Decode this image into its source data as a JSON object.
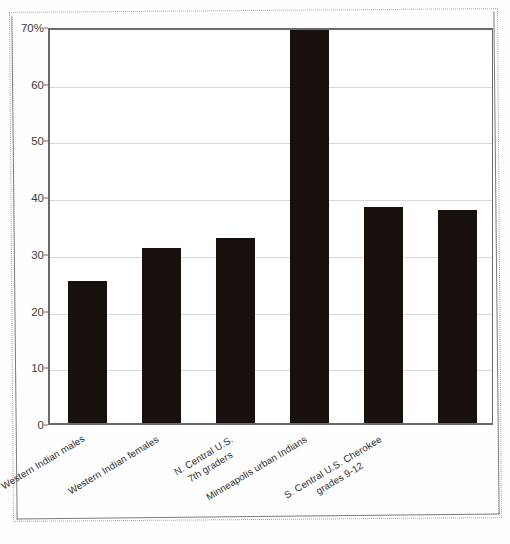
{
  "chart_data": {
    "type": "bar",
    "title": "",
    "xlabel": "",
    "ylabel": "",
    "ylim": [
      0,
      70
    ],
    "grid": true,
    "legend": null,
    "y_unit": "%",
    "y_ticks": [
      "0",
      "10",
      "20",
      "30",
      "40",
      "50",
      "60",
      "70%"
    ],
    "y_tick_values": [
      0,
      10,
      20,
      30,
      40,
      50,
      60,
      70
    ],
    "categories": [
      "Western Indian males",
      "Western Indian females",
      "N. Central U.S.\n7th graders",
      "Minneapolis urban Indians",
      "S. Central U.S. Cherokee\ngrades 9-12",
      ""
    ],
    "category_lines": [
      [
        "Western Indian males"
      ],
      [
        "Western Indian females"
      ],
      [
        "N. Central U.S.",
        "7th graders"
      ],
      [
        "Minneapolis urban Indians"
      ],
      [
        "S. Central U.S. Cherokee",
        "grades 9-12"
      ],
      [
        ""
      ]
    ],
    "values": [
      25.0,
      30.8,
      32.6,
      70.0,
      38.1,
      37.6
    ],
    "value_notes": [
      "",
      "",
      "",
      "bar extends to/above top of axis (clipped at 70%)",
      "",
      "unlabeled category"
    ],
    "bar_color": "#17100c",
    "gridline_color": "#d9d9d9",
    "axis_color": "#6a6a6a"
  },
  "figure": {
    "background_color": "#fefefe",
    "border_style": "dotted-scan-frame"
  }
}
